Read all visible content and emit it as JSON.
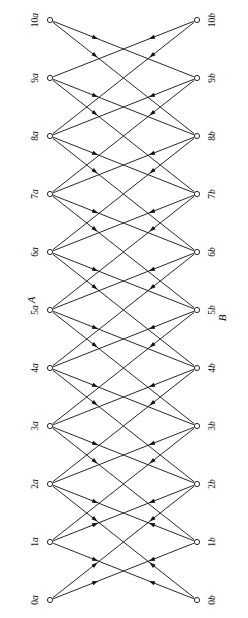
{
  "figure": {
    "kind": "directed-bipartite-graph",
    "title": "",
    "background_color": "#ffffff",
    "stroke_color": "#111111",
    "node_fill_color": "#ffffff",
    "label_rotation_deg": -90,
    "width": 248,
    "height": 618
  },
  "side_labels": [
    {
      "text": "A",
      "name": "column-label-a",
      "x": 31,
      "y": 300
    },
    {
      "text": "B",
      "name": "column-label-b",
      "x": 222,
      "y": 318
    }
  ],
  "columns": [
    {
      "id": "A",
      "name": "left-column",
      "x": 50,
      "nodes": [
        {
          "id": "0a",
          "num": "0",
          "let": "a",
          "label": "0a",
          "y": 600
        },
        {
          "id": "1a",
          "num": "1",
          "let": "a",
          "label": "1a",
          "y": 542
        },
        {
          "id": "2a",
          "num": "2",
          "let": "a",
          "label": "2a",
          "y": 484
        },
        {
          "id": "3a",
          "num": "3",
          "let": "a",
          "label": "3a",
          "y": 426
        },
        {
          "id": "4a",
          "num": "4",
          "let": "a",
          "label": "4a",
          "y": 368
        },
        {
          "id": "5a",
          "num": "5",
          "let": "a",
          "label": "5a",
          "y": 310
        },
        {
          "id": "6a",
          "num": "6",
          "let": "a",
          "label": "6a",
          "y": 252
        },
        {
          "id": "7a",
          "num": "7",
          "let": "a",
          "label": "7a",
          "y": 194
        },
        {
          "id": "8a",
          "num": "8",
          "let": "a",
          "label": "8a",
          "y": 136
        },
        {
          "id": "9a",
          "num": "9",
          "let": "a",
          "label": "9a",
          "y": 78
        },
        {
          "id": "10a",
          "num": "10",
          "let": "a",
          "label": "10a",
          "y": 20
        }
      ]
    },
    {
      "id": "B",
      "name": "right-column",
      "x": 197,
      "nodes": [
        {
          "id": "0b",
          "num": "0",
          "let": "b",
          "label": "0b",
          "y": 600
        },
        {
          "id": "1b",
          "num": "1",
          "let": "b",
          "label": "1b",
          "y": 542
        },
        {
          "id": "2b",
          "num": "2",
          "let": "b",
          "label": "2b",
          "y": 484
        },
        {
          "id": "3b",
          "num": "3",
          "let": "b",
          "label": "3b",
          "y": 426
        },
        {
          "id": "4b",
          "num": "4",
          "let": "b",
          "label": "4b",
          "y": 368
        },
        {
          "id": "5b",
          "num": "5",
          "let": "b",
          "label": "5b",
          "y": 310
        },
        {
          "id": "6b",
          "num": "6",
          "let": "b",
          "label": "6b",
          "y": 252
        },
        {
          "id": "7b",
          "num": "7",
          "let": "b",
          "label": "7b",
          "y": 194
        },
        {
          "id": "8b",
          "num": "8",
          "let": "b",
          "label": "8b",
          "y": 136
        },
        {
          "id": "9b",
          "num": "9",
          "let": "b",
          "label": "9b",
          "y": 78
        },
        {
          "id": "10b",
          "num": "10",
          "let": "b",
          "label": "10b",
          "y": 20
        }
      ]
    }
  ],
  "edges": [
    {
      "from": "10a",
      "to": "9b"
    },
    {
      "from": "10a",
      "to": "8b"
    },
    {
      "from": "9a",
      "to": "8b"
    },
    {
      "from": "9a",
      "to": "7b"
    },
    {
      "from": "8a",
      "to": "7b"
    },
    {
      "from": "8a",
      "to": "6b"
    },
    {
      "from": "7a",
      "to": "6b"
    },
    {
      "from": "7a",
      "to": "5b"
    },
    {
      "from": "6a",
      "to": "5b"
    },
    {
      "from": "6a",
      "to": "4b"
    },
    {
      "from": "5a",
      "to": "4b"
    },
    {
      "from": "5a",
      "to": "3b"
    },
    {
      "from": "4a",
      "to": "3b"
    },
    {
      "from": "4a",
      "to": "2b"
    },
    {
      "from": "3a",
      "to": "2b"
    },
    {
      "from": "3a",
      "to": "1b"
    },
    {
      "from": "2a",
      "to": "1b"
    },
    {
      "from": "2a",
      "to": "0b"
    },
    {
      "from": "1a",
      "to": "0b"
    },
    {
      "from": "10b",
      "to": "9a"
    },
    {
      "from": "10b",
      "to": "8a"
    },
    {
      "from": "9b",
      "to": "8a"
    },
    {
      "from": "9b",
      "to": "7a"
    },
    {
      "from": "8b",
      "to": "7a"
    },
    {
      "from": "8b",
      "to": "6a"
    },
    {
      "from": "7b",
      "to": "6a"
    },
    {
      "from": "7b",
      "to": "5a"
    },
    {
      "from": "6b",
      "to": "5a"
    },
    {
      "from": "6b",
      "to": "4a"
    },
    {
      "from": "5b",
      "to": "4a"
    },
    {
      "from": "5b",
      "to": "3a"
    },
    {
      "from": "4b",
      "to": "3a"
    },
    {
      "from": "4b",
      "to": "2a"
    },
    {
      "from": "3b",
      "to": "2a"
    },
    {
      "from": "3b",
      "to": "1a"
    },
    {
      "from": "2b",
      "to": "1a"
    },
    {
      "from": "2b",
      "to": "0a"
    },
    {
      "from": "1b",
      "to": "0a"
    },
    {
      "from": "0a",
      "to": "1b"
    },
    {
      "from": "0a",
      "to": "2b"
    },
    {
      "from": "0b",
      "to": "1a"
    },
    {
      "from": "0b",
      "to": "2a"
    },
    {
      "from": "1a",
      "to": "2b"
    },
    {
      "from": "1b",
      "to": "2a"
    }
  ]
}
